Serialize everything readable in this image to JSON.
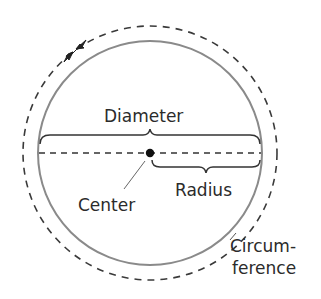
{
  "diagram": {
    "labels": {
      "diameter": "Diameter",
      "radius": "Radius",
      "center": "Center",
      "circumference_line1": "Circum-",
      "circumference_line2": "ference"
    },
    "colors": {
      "circle_stroke": "#8a8a8a",
      "dashed_stroke": "#3a3a3a",
      "bracket_stroke": "#333333",
      "text": "#2b2b2b",
      "center_dot": "#111111"
    }
  }
}
